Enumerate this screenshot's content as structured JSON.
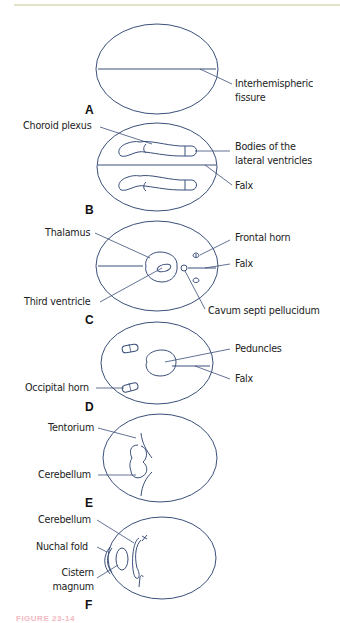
{
  "figure": {
    "caption_fragment": "FIGURE 23-14",
    "colors": {
      "stroke": "#3b4f7a",
      "text": "#222222",
      "top_rule": "#e3e3c8",
      "caption": "#f2b8c0"
    },
    "panels": [
      {
        "id": "A",
        "label": "A",
        "annotations": [
          "Interhemispheric fissure"
        ]
      },
      {
        "id": "B",
        "label": "B",
        "annotations": [
          "Choroid plexus",
          "Bodies of the lateral ventricles",
          "Falx"
        ]
      },
      {
        "id": "C",
        "label": "C",
        "annotations": [
          "Thalamus",
          "Frontal horn",
          "Falx",
          "Third ventricle",
          "Cavum septi pellucidum"
        ]
      },
      {
        "id": "D",
        "label": "D",
        "annotations": [
          "Peduncles",
          "Falx",
          "Occipital horn"
        ]
      },
      {
        "id": "E",
        "label": "E",
        "annotations": [
          "Tentorium",
          "Cerebellum"
        ]
      },
      {
        "id": "F",
        "label": "F",
        "annotations": [
          "Cerebellum",
          "Nuchal fold",
          "Cistern magnum"
        ]
      }
    ]
  },
  "labels": {
    "a_fissure_1": "Interhemispheric",
    "a_fissure_2": "fissure",
    "b_choroid": "Choroid plexus",
    "b_bodies_1": "Bodies of the",
    "b_bodies_2": "lateral ventricles",
    "b_falx": "Falx",
    "c_thalamus": "Thalamus",
    "c_frontal": "Frontal horn",
    "c_falx": "Falx",
    "c_third": "Third ventricle",
    "c_cavum": "Cavum septi pellucidum",
    "d_peduncles": "Peduncles",
    "d_falx": "Falx",
    "d_occipital": "Occipital horn",
    "e_tentorium": "Tentorium",
    "e_cerebellum": "Cerebellum",
    "f_cerebellum": "Cerebellum",
    "f_nuchal": "Nuchal fold",
    "f_cistern_1": "Cistern",
    "f_cistern_2": "magnum"
  }
}
